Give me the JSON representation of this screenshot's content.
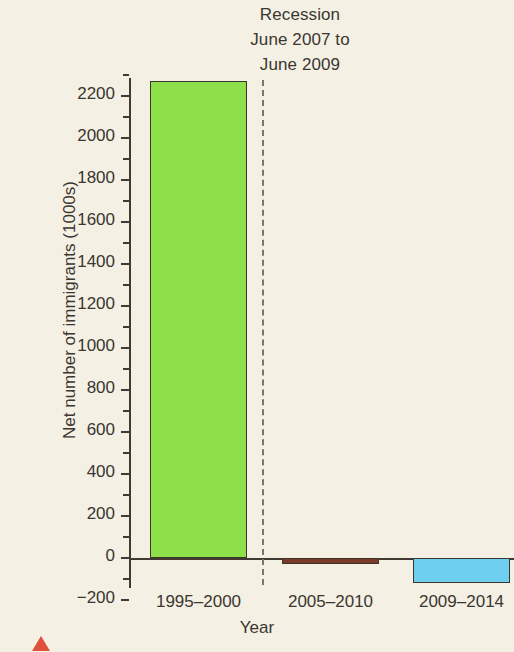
{
  "chart_data": {
    "type": "bar",
    "title": "",
    "annotation": [
      "Recession",
      "June 2007 to",
      "June 2009"
    ],
    "categories": [
      "1995–2000",
      "2005–2010",
      "2009–2014"
    ],
    "values": [
      2270,
      -30,
      -120
    ],
    "series": [
      {
        "name": "Net number of immigrants (1000s)",
        "values": [
          2270,
          -30,
          -120
        ]
      }
    ],
    "bar_colors": [
      "#8DE04A",
      "#7A3A28",
      "#6ECFF0"
    ],
    "xlabel": "Year",
    "ylabel": "Net number of immigrants (1000s)",
    "ylim": [
      -260,
      2360
    ],
    "ytick_labels": [
      "2200",
      "2000",
      "1800",
      "1600",
      "1400",
      "1200",
      "1000",
      "800",
      "600",
      "400",
      "200",
      "0",
      "−200"
    ],
    "ytick_values": [
      2200,
      2000,
      1800,
      1600,
      1400,
      1200,
      1000,
      800,
      600,
      400,
      200,
      0,
      -200
    ],
    "minor_ytick_values": [
      2300,
      2100,
      1900,
      1700,
      1500,
      1300,
      1100,
      900,
      700,
      500,
      300,
      100,
      -100
    ],
    "grid": false,
    "legend": false,
    "legend_position": "none",
    "divider": {
      "name": "recession-divider",
      "style": "dashed",
      "color": "#7e7468",
      "between_categories": [
        "1995–2000",
        "2005–2010"
      ]
    },
    "colors": {
      "background": "#f4f0e4",
      "axis": "#403a33",
      "text": "#3b3630",
      "marker": "#e0503a"
    }
  }
}
